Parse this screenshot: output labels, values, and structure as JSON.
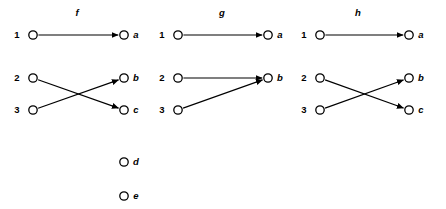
{
  "figure": {
    "background_color": "#ffffff",
    "ink_color": "#000000",
    "width": 446,
    "height": 209
  },
  "node_geometry": {
    "radius": 4.2,
    "rows": {
      "r1": 35,
      "r2": 78,
      "r3": 110,
      "r4": 162,
      "r5": 196
    },
    "title_y": 16
  },
  "panels": [
    {
      "id": "f",
      "title": "f",
      "title_x": 77,
      "domain_x": 33,
      "codomain_x": 124,
      "domain_label_x": 17,
      "codomain_label_x": 136,
      "domain_nodes": [
        {
          "label": "1",
          "row": "r1"
        },
        {
          "label": "2",
          "row": "r2"
        },
        {
          "label": "3",
          "row": "r3"
        }
      ],
      "codomain_nodes": [
        {
          "label": "a",
          "row": "r1"
        },
        {
          "label": "b",
          "row": "r2"
        },
        {
          "label": "c",
          "row": "r3"
        },
        {
          "label": "d",
          "row": "r4"
        },
        {
          "label": "e",
          "row": "r5"
        }
      ],
      "edges": [
        {
          "from": "1",
          "to": "a"
        },
        {
          "from": "2",
          "to": "c"
        },
        {
          "from": "3",
          "to": "b"
        }
      ]
    },
    {
      "id": "g",
      "title": "g",
      "title_x": 222,
      "domain_x": 178,
      "codomain_x": 268,
      "domain_label_x": 162,
      "codomain_label_x": 280,
      "domain_nodes": [
        {
          "label": "1",
          "row": "r1"
        },
        {
          "label": "2",
          "row": "r2"
        },
        {
          "label": "3",
          "row": "r3"
        }
      ],
      "codomain_nodes": [
        {
          "label": "a",
          "row": "r1"
        },
        {
          "label": "b",
          "row": "r2"
        }
      ],
      "edges": [
        {
          "from": "1",
          "to": "a"
        },
        {
          "from": "2",
          "to": "b"
        },
        {
          "from": "3",
          "to": "b"
        }
      ]
    },
    {
      "id": "h",
      "title": "h",
      "title_x": 358,
      "domain_x": 320,
      "codomain_x": 409,
      "domain_label_x": 304,
      "codomain_label_x": 421,
      "domain_nodes": [
        {
          "label": "1",
          "row": "r1"
        },
        {
          "label": "2",
          "row": "r2"
        },
        {
          "label": "3",
          "row": "r3"
        }
      ],
      "codomain_nodes": [
        {
          "label": "a",
          "row": "r1"
        },
        {
          "label": "b",
          "row": "r2"
        },
        {
          "label": "c",
          "row": "r3"
        }
      ],
      "edges": [
        {
          "from": "1",
          "to": "a"
        },
        {
          "from": "2",
          "to": "c"
        },
        {
          "from": "3",
          "to": "b"
        }
      ]
    }
  ]
}
